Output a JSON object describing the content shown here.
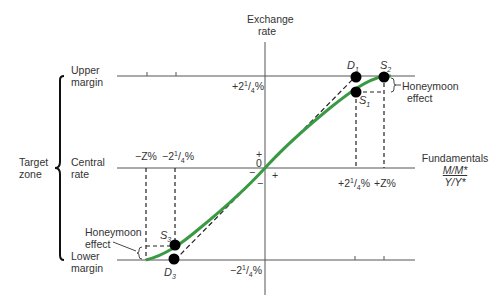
{
  "diagram": {
    "type": "target-zone-exchange-rate",
    "y_axis_label_line1": "Exchange",
    "y_axis_label_line2": "rate",
    "x_axis_label": "Fundamentals",
    "x_axis_fraction_numerator": "M/M*",
    "x_axis_fraction_denominator": "Y/Y*",
    "bracket_label_line1": "Target",
    "bracket_label_line2": "zone",
    "levels": [
      {
        "line1": "Upper",
        "line2": "margin"
      },
      {
        "line1": "Central",
        "line2": "rate"
      },
      {
        "line1": "Lower",
        "line2": "margin"
      }
    ],
    "y_ticks": {
      "upper": {
        "sign": "+2",
        "sup": "1",
        "sub": "4",
        "suffix": "%"
      },
      "lower": {
        "sign": "−2",
        "sup": "1",
        "sub": "4",
        "suffix": "%"
      }
    },
    "x_ticks": {
      "neg_z": "−Z%",
      "neg_q": {
        "sign": "−2",
        "sup": "1",
        "sub": "4",
        "suffix": "%"
      },
      "pos_q": {
        "sign": "+2",
        "sup": "1",
        "sub": "4",
        "suffix": "%"
      },
      "pos_z": "+Z%"
    },
    "origin": {
      "zero": "0",
      "plus_up": "+",
      "minus_down": "−",
      "minus_left": "−",
      "plus_right": "+"
    },
    "points": {
      "D1": {
        "letter": "D",
        "sub": "1"
      },
      "S1": {
        "letter": "S",
        "sub": "1"
      },
      "S2": {
        "letter": "S",
        "sub": "2"
      },
      "S3": {
        "letter": "S",
        "sub": "3"
      },
      "D3": {
        "letter": "D",
        "sub": "3"
      }
    },
    "honeymoon_upper_line1": "Honeymoon",
    "honeymoon_upper_line2": "effect",
    "honeymoon_lower_line1": "Honeymoon",
    "honeymoon_lower_line2": "effect",
    "colors": {
      "curve": "#3a9a44",
      "lines": "#555555",
      "dashed": "#222222",
      "points": "#000000"
    }
  }
}
